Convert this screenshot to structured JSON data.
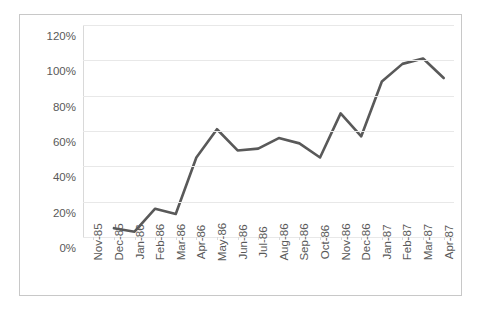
{
  "chart_data": {
    "type": "line",
    "title": "",
    "xlabel": "",
    "ylabel": "",
    "ylim": [
      0,
      120
    ],
    "ytick_values": [
      0,
      20,
      40,
      60,
      80,
      100,
      120
    ],
    "ytick_labels": [
      "0%",
      "20%",
      "40%",
      "60%",
      "80%",
      "100%",
      "120%"
    ],
    "grid": true,
    "legend": "none",
    "categories": [
      "Nov-85",
      "Dec-85",
      "Jan-86",
      "Feb-86",
      "Mar-86",
      "Apr-86",
      "May-86",
      "Jun-86",
      "Jul-86",
      "Aug-86",
      "Sep-86",
      "Oct-86",
      "Nov-86",
      "Dec-86",
      "Jan-87",
      "Feb-87",
      "Mar-87",
      "Apr-87"
    ],
    "series": [
      {
        "name": "Series 1",
        "color": "#595959",
        "values": [
          null,
          5,
          3,
          16,
          13,
          45,
          61,
          49,
          50,
          56,
          53,
          45,
          70,
          57,
          88,
          98,
          101,
          90
        ]
      }
    ]
  }
}
